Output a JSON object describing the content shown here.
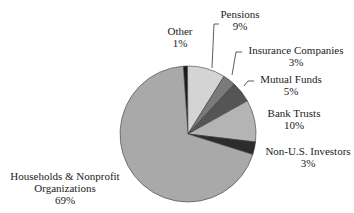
{
  "chart_data": {
    "type": "pie",
    "title": "",
    "categories": [
      "Other",
      "Pensions",
      "Insurance Companies",
      "Mutual Funds",
      "Bank Trusts",
      "Non-U.S. Investors",
      "Households & Nonprofit Organizations"
    ],
    "values": [
      1,
      9,
      3,
      5,
      10,
      3,
      69
    ],
    "value_labels": [
      "1%",
      "9%",
      "3%",
      "5%",
      "10%",
      "3%",
      "69%"
    ],
    "colors": [
      "#1a1a1a",
      "#d4d4d4",
      "#7a7a7a",
      "#555555",
      "#b4b4b4",
      "#2c2c2c",
      "#a9a9a9"
    ],
    "start_angle_deg": -4,
    "direction": "clockwise",
    "legend": "none (direct labels with leader lines)"
  },
  "labels": [
    {
      "name": "Other",
      "pct": "1%"
    },
    {
      "name": "Pensions",
      "pct": "9%"
    },
    {
      "name": "Insurance Companies",
      "pct": "3%"
    },
    {
      "name": "Mutual Funds",
      "pct": "5%"
    },
    {
      "name": "Bank Trusts",
      "pct": "10%"
    },
    {
      "name": "Non-U.S. Investors",
      "pct": "3%"
    },
    {
      "name": "Households & Nonprofit",
      "name2": "Organizations",
      "pct": "69%"
    }
  ]
}
